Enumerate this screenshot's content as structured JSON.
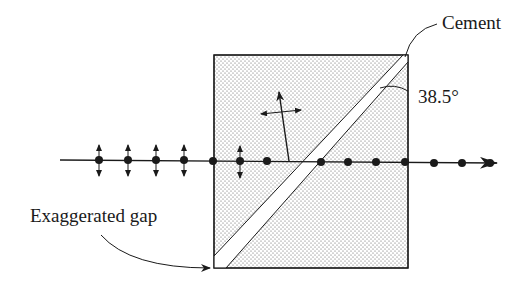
{
  "diagram": {
    "type": "Glan-type polarizing prism with cemented diagonal interface",
    "labels": {
      "cement": "Cement",
      "angle": "38.5°",
      "gap": "Exaggerated gap"
    },
    "colors": {
      "ink": "#1a1a1a",
      "stipple": "#555555",
      "background": "#ffffff"
    },
    "incident_beam": {
      "polarization_markers": [
        "vertical",
        "vertical",
        "vertical",
        "vertical"
      ],
      "dot_count_before_prism": 4
    },
    "transmitted_beam": {
      "polarization": "dots (perpendicular to page)",
      "dot_count_after_prism": 3
    },
    "reflected_beam": {
      "polarization": "in-plane (double arrow)"
    }
  }
}
